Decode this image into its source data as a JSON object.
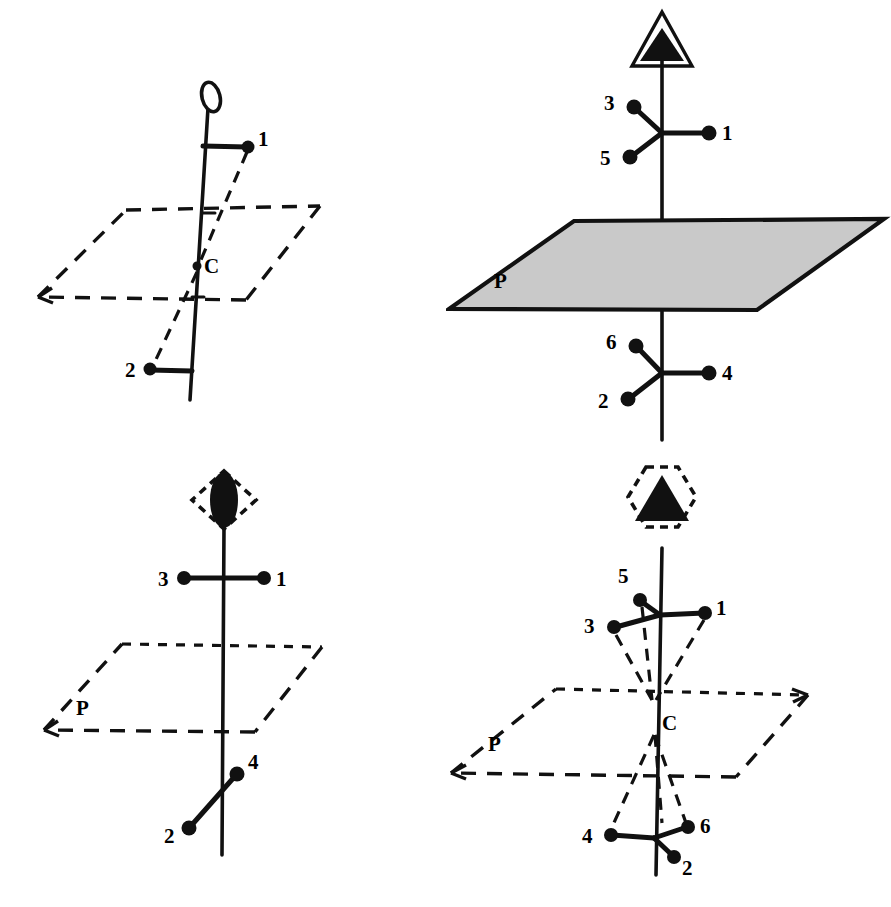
{
  "figure": {
    "background_color": "#ffffff",
    "ink_color": "#111111",
    "plane_fill_color": "#c9c9c9",
    "panel_count": 4
  },
  "panels": [
    {
      "id": "top-left",
      "position": "top-left",
      "symmetry_symbol": "open-ellipse-icon",
      "symmetry_symbol_meaning": "centre of symmetry (inversion centre, 1-bar)",
      "plane": {
        "label": "",
        "style": "dashed",
        "filled": false
      },
      "centre_label": "C",
      "atoms": [
        {
          "label": "1",
          "placement": "upper-right"
        },
        {
          "label": "2",
          "placement": "lower-left"
        }
      ],
      "atom_count": 2
    },
    {
      "id": "top-right",
      "position": "top-right",
      "symmetry_symbol": "filled-triangle-outline-icon",
      "symmetry_symbol_meaning": "three-fold rotation axis (3)",
      "plane": {
        "label": "P",
        "style": "solid",
        "filled": true
      },
      "centre_label": "",
      "atoms": [
        {
          "label": "3",
          "placement": "upper-left"
        },
        {
          "label": "1",
          "placement": "upper-right"
        },
        {
          "label": "5",
          "placement": "upper-lower-left"
        },
        {
          "label": "6",
          "placement": "lower-upper-left"
        },
        {
          "label": "4",
          "placement": "lower-right"
        },
        {
          "label": "2",
          "placement": "lower-left"
        }
      ],
      "atom_count": 6
    },
    {
      "id": "bottom-left",
      "position": "bottom-left",
      "symmetry_symbol": "filled-lens-in-open-diamond-icon",
      "symmetry_symbol_meaning": "two-fold inversion axis (2-bar = mirror plane)",
      "plane": {
        "label": "P",
        "style": "dashed",
        "filled": false
      },
      "centre_label": "",
      "atoms": [
        {
          "label": "3",
          "placement": "upper-left"
        },
        {
          "label": "1",
          "placement": "upper-right"
        },
        {
          "label": "4",
          "placement": "lower-right"
        },
        {
          "label": "2",
          "placement": "lower-left"
        }
      ],
      "atom_count": 4
    },
    {
      "id": "bottom-right",
      "position": "bottom-right",
      "symmetry_symbol": "filled-triangle-in-dashed-hexagon-icon",
      "symmetry_symbol_meaning": "six-fold inversion axis (6-bar)",
      "plane": {
        "label": "P",
        "style": "dashed",
        "filled": false
      },
      "centre_label": "C",
      "atoms": [
        {
          "label": "5",
          "placement": "upper-left-high"
        },
        {
          "label": "3",
          "placement": "upper-left"
        },
        {
          "label": "1",
          "placement": "upper-right"
        },
        {
          "label": "4",
          "placement": "lower-left"
        },
        {
          "label": "6",
          "placement": "lower-right"
        },
        {
          "label": "2",
          "placement": "lower-right-low"
        }
      ],
      "atom_count": 6
    }
  ],
  "labels": {
    "centre_c": "C",
    "plane_p": "P",
    "atom_1": "1",
    "atom_2": "2",
    "atom_3": "3",
    "atom_4": "4",
    "atom_5": "5",
    "atom_6": "6"
  }
}
